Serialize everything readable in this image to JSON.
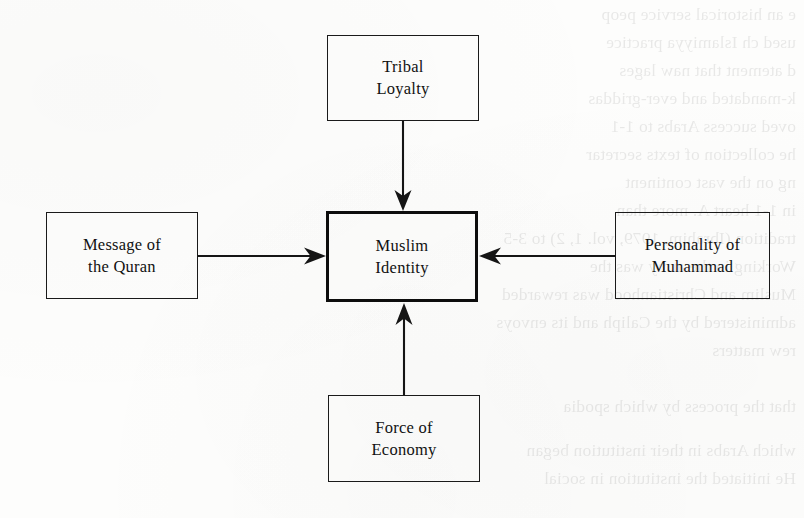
{
  "page": {
    "kind": "scanned-book-page-diagram",
    "width": 804,
    "height": 518,
    "background_color": "#fdfdfc",
    "ink_color": "#151515"
  },
  "diagram": {
    "type": "flow-diagram",
    "center_node": "muslim-identity",
    "nodes": [
      {
        "id": "tribal-loyalty",
        "position": "top",
        "label": "Tribal\nLoyalty",
        "line1": "Tribal",
        "line2": "Loyalty",
        "emphasis": false
      },
      {
        "id": "message-of-the-quran",
        "position": "left",
        "label": "Message of\nthe Quran",
        "line1": "Message of",
        "line2": "the Quran",
        "emphasis": false
      },
      {
        "id": "muslim-identity",
        "position": "center",
        "label": "Muslim\nIdentity",
        "line1": "Muslim",
        "line2": "Identity",
        "emphasis": true
      },
      {
        "id": "personality-of-muhammad",
        "position": "right",
        "label": "Personality of\nMuhammad",
        "line1": "Personality of",
        "line2": "Muhammad",
        "emphasis": false
      },
      {
        "id": "force-of-economy",
        "position": "bottom",
        "label": "Force of\nEconomy",
        "line1": "Force of",
        "line2": "Economy",
        "emphasis": false
      }
    ],
    "edges": [
      {
        "id": "edge-top",
        "from": "tribal-loyalty",
        "to": "muslim-identity",
        "direction": "down"
      },
      {
        "id": "edge-left",
        "from": "message-of-the-quran",
        "to": "muslim-identity",
        "direction": "right"
      },
      {
        "id": "edge-right",
        "from": "personality-of-muhammad",
        "to": "muslim-identity",
        "direction": "left"
      },
      {
        "id": "edge-bottom",
        "from": "force-of-economy",
        "to": "muslim-identity",
        "direction": "up"
      }
    ]
  },
  "bleed_through": {
    "note": "faint mirrored show-through text from the reverse of the scanned page",
    "lines": [
      "e an historical service peop",
      "used ch Islamiyya practice",
      "d atement that naw lages",
      "k-mandated and ever-griddas",
      "oved success Arabs to 1-1",
      "he collection of texts secretar",
      "ng on the vast continent",
      "in 1-1 heart A. more than",
      "tradition (Ibrahim, 1979, vol. 1, 2) to 3-5",
      "Working in the army was the",
      "Muslim and Christianhood was rewarded",
      "administered by the Caliph and its envoys",
      "rew matters",
      "that the process by which spodia",
      "which Arabs in their institution began",
      "He initiated the institution in social"
    ]
  }
}
